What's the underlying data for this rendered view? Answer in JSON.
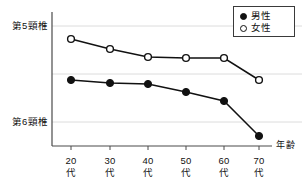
{
  "chart_data": {
    "type": "line",
    "title": "",
    "xlabel": "年齢",
    "ylabel": "",
    "categories": [
      "20代",
      "30代",
      "40代",
      "50代",
      "60代",
      "70代"
    ],
    "x_tick_numbers": [
      "20",
      "30",
      "40",
      "50",
      "60",
      "70"
    ],
    "x_tick_units": [
      "代",
      "代",
      "代",
      "代",
      "代",
      "代"
    ],
    "y_axis_ticks": [
      "第5頸椎",
      "第6頸椎"
    ],
    "y_gridlines_px": [
      26,
      74,
      122
    ],
    "grid": true,
    "legend_position": "top-right",
    "series": [
      {
        "name": "男性",
        "marker": "filled-circle",
        "color": "#111111",
        "values_px_y": [
          80,
          83,
          84,
          92,
          101,
          136
        ]
      },
      {
        "name": "女性",
        "marker": "open-circle",
        "color": "#111111",
        "values_px_y": [
          39,
          49,
          57,
          58,
          58,
          80
        ]
      }
    ],
    "x_positions_px": [
      71,
      110,
      148,
      186,
      224,
      259
    ],
    "plot_area_px": {
      "left": 52,
      "right": 270,
      "top": 12,
      "bottom": 146
    }
  },
  "axis": {
    "y_label_top": "第5頸椎",
    "y_label_bottom": "第6頸椎",
    "x_axis_caption": "年齢"
  },
  "legend": {
    "items": [
      {
        "label": "男性",
        "marker": "filled-circle"
      },
      {
        "label": "女性",
        "marker": "open-circle"
      }
    ]
  },
  "colors": {
    "line": "#111111",
    "grid": "#dcdcdc",
    "axis": "#4a4a4a",
    "background": "#ffffff"
  }
}
